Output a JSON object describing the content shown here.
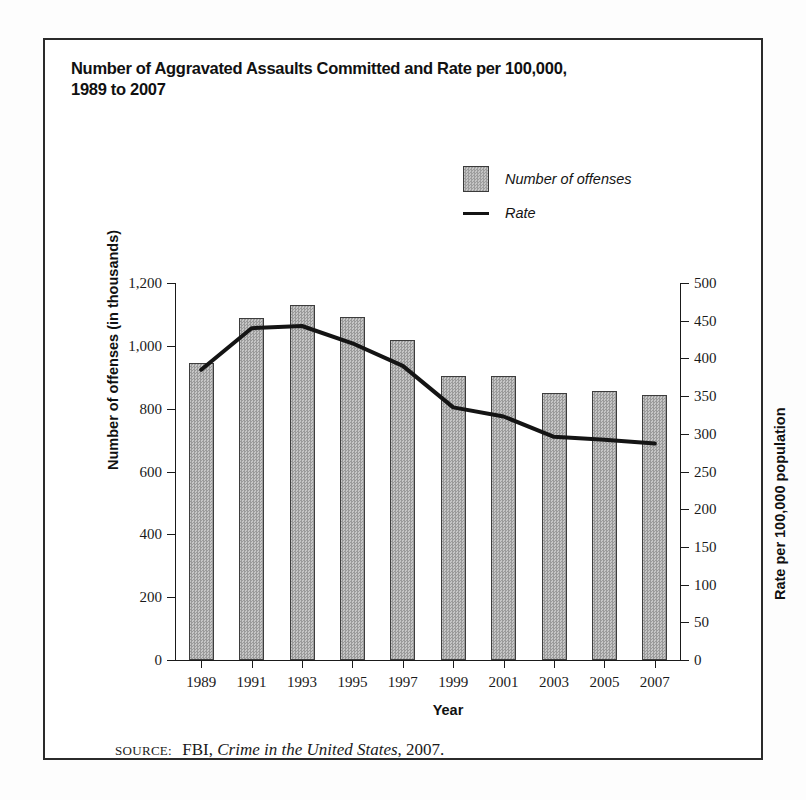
{
  "figure": {
    "title": "Number of Aggravated Assaults Committed and Rate per 100,000,\n1989 to 2007",
    "source_prefix": "SOURCE:",
    "source_agency": "FBI,",
    "source_publication": "Crime in the United States",
    "source_year": ", 2007."
  },
  "legend": {
    "items": [
      {
        "label": "Number of offenses",
        "marker": "bar-swatch-icon"
      },
      {
        "label": "Rate",
        "marker": "line-swatch-icon"
      }
    ]
  },
  "chart_data": {
    "type": "bar",
    "title": "Number of Aggravated Assaults Committed and Rate per 100,000, 1989 to 2007",
    "xlabel": "Year",
    "ylabel": "Number of offenses (in thousands)",
    "y2label": "Rate per 100,000 population",
    "categories": [
      "1989",
      "1991",
      "1993",
      "1995",
      "1997",
      "1999",
      "2001",
      "2003",
      "2005",
      "2007"
    ],
    "grid": false,
    "legend_position": "top-right",
    "series": [
      {
        "name": "Number of offenses",
        "type": "bar",
        "axis": "left",
        "units": "thousands",
        "values": [
          945,
          1088,
          1130,
          1093,
          1018,
          905,
          905,
          850,
          855,
          845
        ]
      },
      {
        "name": "Rate",
        "type": "line",
        "axis": "right",
        "units": "per 100,000 population",
        "values": [
          385,
          440,
          443,
          420,
          390,
          335,
          323,
          296,
          292,
          287
        ]
      }
    ],
    "ylim": [
      0,
      1200
    ],
    "yticks": [
      0,
      200,
      400,
      600,
      800,
      1000,
      1200
    ],
    "ytick_labels": [
      "0",
      "200",
      "400",
      "600",
      "800",
      "1,000",
      "1,200"
    ],
    "y2lim": [
      0,
      500
    ],
    "y2ticks": [
      0,
      50,
      100,
      150,
      200,
      250,
      300,
      350,
      400,
      450,
      500
    ],
    "y2tick_labels": [
      "0",
      "50",
      "100",
      "150",
      "200",
      "250",
      "300",
      "350",
      "400",
      "450",
      "500"
    ]
  }
}
